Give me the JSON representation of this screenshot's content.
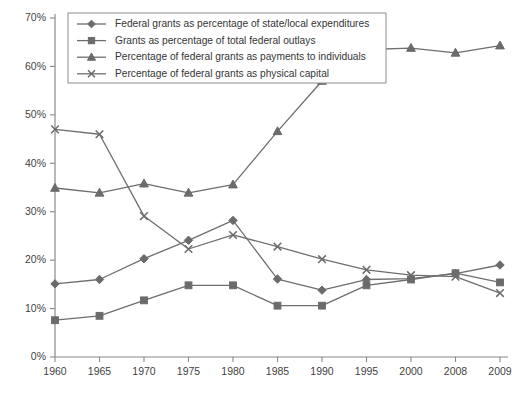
{
  "chart_data": {
    "type": "line",
    "title": "",
    "subtitle": "",
    "xlabel": "",
    "ylabel": "",
    "grid": false,
    "legend_position": "top-left-inside",
    "categories": [
      "1960",
      "1965",
      "1970",
      "1975",
      "1980",
      "1985",
      "1990",
      "1995",
      "2000",
      "2008",
      "2009"
    ],
    "x": [
      1960,
      1965,
      1970,
      1975,
      1980,
      1985,
      1990,
      1995,
      2000,
      2008,
      2009
    ],
    "ylim": [
      0,
      70
    ],
    "yticks": [
      0,
      10,
      20,
      30,
      40,
      50,
      60,
      70
    ],
    "ytick_labels": [
      "0%",
      "10%",
      "20%",
      "30%",
      "40%",
      "50%",
      "60%",
      "70%"
    ],
    "xtick_labels": [
      "1960",
      "1965",
      "1970",
      "1975",
      "1980",
      "1985",
      "1990",
      "1995",
      "2000",
      "2008",
      "2009"
    ],
    "series": [
      {
        "name": "Federal grants as percentage of state/local expenditures",
        "marker": "diamond",
        "color": "#6b6b6b",
        "values": [
          15.1,
          16.0,
          20.3,
          24.1,
          28.2,
          16.1,
          13.8,
          16.0,
          16.2,
          17.2,
          19.0
        ]
      },
      {
        "name": "Grants as percentage of total federal outlays",
        "marker": "square",
        "color": "#6b6b6b",
        "values": [
          7.6,
          8.5,
          11.7,
          14.8,
          14.8,
          10.6,
          10.6,
          14.8,
          16.0,
          17.3,
          15.4
        ]
      },
      {
        "name": "Percentage of federal grants as payments to individuals",
        "marker": "triangle",
        "color": "#6b6b6b",
        "values": [
          34.9,
          33.9,
          35.8,
          33.9,
          35.6,
          46.6,
          57.0,
          63.5,
          63.8,
          62.8,
          64.3
        ]
      },
      {
        "name": "Percentage of federal grants as physical capital",
        "marker": "x",
        "color": "#6b6b6b",
        "values": [
          47.0,
          46.0,
          29.1,
          22.3,
          25.2,
          22.8,
          20.2,
          18.0,
          16.9,
          16.6,
          13.2
        ]
      }
    ]
  },
  "legend": {
    "items": [
      {
        "label": "Federal grants as percentage of state/local expenditures",
        "marker": "diamond"
      },
      {
        "label": "Grants as percentage of total federal outlays",
        "marker": "square"
      },
      {
        "label": "Percentage of federal grants as payments to individuals",
        "marker": "triangle"
      },
      {
        "label": "Percentage of federal grants as physical capital",
        "marker": "x"
      }
    ]
  },
  "colors": {
    "ink": "#6b6b6b",
    "axis": "#8a8a8a",
    "text": "#3a3a3a",
    "background": "#ffffff"
  }
}
